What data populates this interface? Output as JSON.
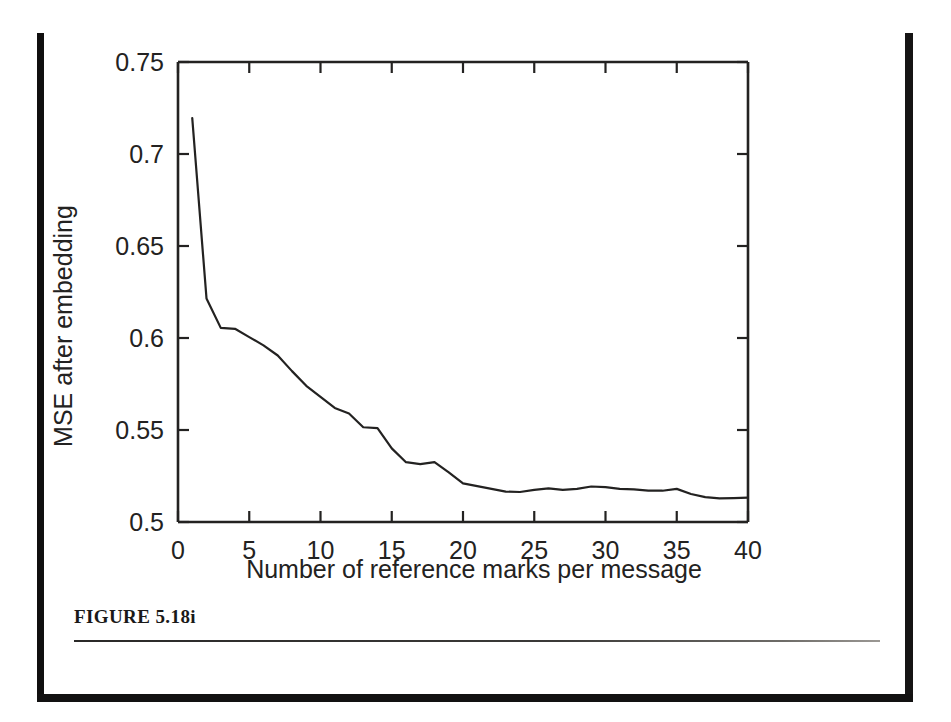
{
  "page": {
    "figure_caption": "FIGURE 5.18i",
    "border_color": "#121111",
    "ink_color": "#232221"
  },
  "chart_data": {
    "type": "line",
    "title": "",
    "xlabel": "Number of reference marks per message",
    "ylabel": "MSE after embedding",
    "xlim": [
      0,
      40
    ],
    "ylim": [
      0.5,
      0.75
    ],
    "xticks": [
      0,
      5,
      10,
      15,
      20,
      25,
      30,
      35,
      40
    ],
    "xtick_labels": [
      "0",
      "5",
      "10",
      "15",
      "20",
      "25",
      "30",
      "35",
      "40"
    ],
    "yticks": [
      0.5,
      0.55,
      0.6,
      0.65,
      0.7,
      0.75
    ],
    "ytick_labels": [
      "0.5",
      "0.55",
      "0.6",
      "0.65",
      "0.7",
      "0.75"
    ],
    "grid": false,
    "legend": null,
    "line_color": "#232221",
    "line_width": 2.2,
    "x": [
      1,
      2,
      3,
      4,
      5,
      6,
      7,
      8,
      9,
      10,
      11,
      12,
      13,
      14,
      15,
      16,
      17,
      18,
      19,
      20,
      21,
      22,
      23,
      24,
      25,
      26,
      27,
      28,
      29,
      30,
      31,
      32,
      33,
      34,
      35,
      36,
      37,
      38,
      39,
      40
    ],
    "y": [
      0.7195,
      0.6215,
      0.6055,
      0.605,
      0.6005,
      0.596,
      0.5905,
      0.582,
      0.574,
      0.568,
      0.562,
      0.559,
      0.5515,
      0.551,
      0.54,
      0.5325,
      0.5315,
      0.5325,
      0.527,
      0.521,
      0.5195,
      0.518,
      0.5165,
      0.5163,
      0.5175,
      0.5183,
      0.5175,
      0.518,
      0.5193,
      0.519,
      0.518,
      0.5177,
      0.517,
      0.517,
      0.518,
      0.5152,
      0.5135,
      0.5128,
      0.513,
      0.5132
    ]
  }
}
